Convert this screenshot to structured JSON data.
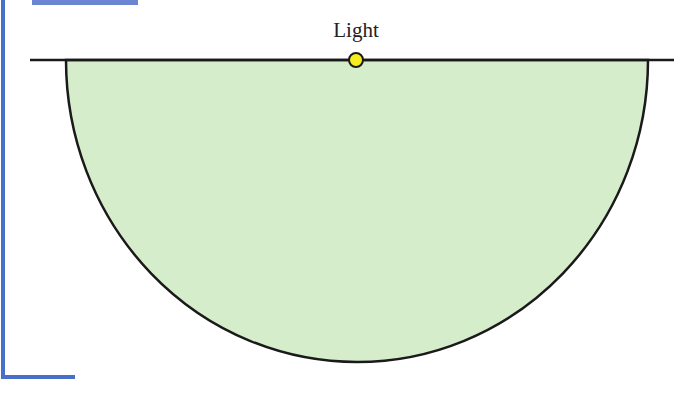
{
  "diagram": {
    "light_label": "Light",
    "colors": {
      "fill": "#d6edcc",
      "stroke": "#1a1a1a",
      "light": "#f5ee1e",
      "frame": "#4a6fc6"
    }
  }
}
